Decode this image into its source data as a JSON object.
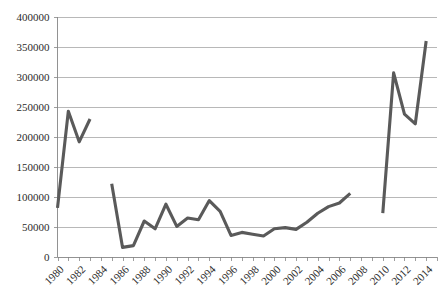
{
  "chart_data": {
    "type": "line",
    "title": "",
    "subtitle": "",
    "xlabel": "",
    "ylabel": "",
    "xlim": [
      1980,
      2015
    ],
    "ylim": [
      0,
      400000
    ],
    "grid": true,
    "legend": false,
    "legend_position": "none",
    "y_ticks": [
      0,
      50000,
      100000,
      150000,
      200000,
      250000,
      300000,
      350000,
      400000
    ],
    "y_tick_labels": [
      "0",
      "50000",
      "100000",
      "150000",
      "200000",
      "250000",
      "300000",
      "350000",
      "400000"
    ],
    "x_ticks": [
      1980,
      1982,
      1984,
      1986,
      1988,
      1990,
      1992,
      1994,
      1996,
      1998,
      2000,
      2002,
      2004,
      2006,
      2008,
      2010,
      2012,
      2014
    ],
    "x_tick_labels": [
      "1980",
      "1982",
      "1984",
      "1986",
      "1988",
      "1990",
      "1992",
      "1994",
      "1996",
      "1998",
      "2000",
      "2002",
      "2004",
      "2006",
      "2008",
      "2010",
      "2012",
      "2014"
    ],
    "x_minor_tick_interval": 1,
    "line_color": "#5a5a5a",
    "gridline_color": "#a6a6a6",
    "background_color": "#ffffff",
    "series": [
      {
        "name": "series-1",
        "note": "drawn as three disconnected segments with data gaps at 1984 and 2008-2009",
        "x": [
          1980,
          1981,
          1982,
          1983
        ],
        "values": [
          82000,
          243000,
          192000,
          230000
        ]
      },
      {
        "name": "series-2",
        "x": [
          1985,
          1986,
          1987,
          1988,
          1989,
          1990,
          1991,
          1992,
          1993,
          1994,
          1995,
          1996,
          1997,
          1998,
          1999,
          2000,
          2001,
          2002,
          2003,
          2004,
          2005,
          2006,
          2007
        ],
        "values": [
          122000,
          16000,
          19000,
          60000,
          47000,
          88000,
          51000,
          65000,
          62000,
          94000,
          76000,
          36000,
          41000,
          38000,
          35000,
          47000,
          49000,
          46000,
          58000,
          73000,
          84000,
          90000,
          106000
        ]
      },
      {
        "name": "series-3",
        "x": [
          2010,
          2011,
          2012,
          2013,
          2014
        ],
        "values": [
          73000,
          307000,
          238000,
          222000,
          360000
        ]
      }
    ]
  }
}
